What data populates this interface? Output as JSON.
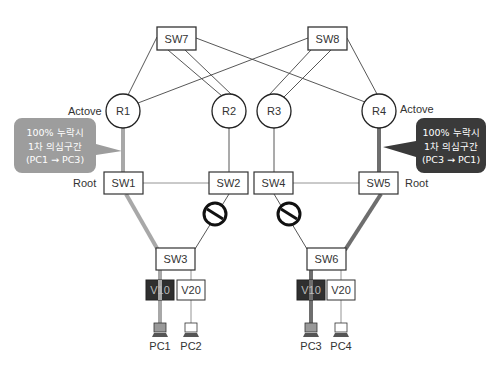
{
  "diagram": {
    "colors": {
      "line": "#444444",
      "path_left": "#a8a8a8",
      "path_right": "#6e6e6e",
      "callout_left": "#9d9d9d",
      "callout_right": "#3a3a3a",
      "vlan_dark": "#2f2f2f"
    },
    "core_switches": [
      {
        "id": "SW7",
        "label": "SW7"
      },
      {
        "id": "SW8",
        "label": "SW8"
      }
    ],
    "routers": [
      {
        "id": "R1",
        "label": "R1",
        "role": "Actove"
      },
      {
        "id": "R2",
        "label": "R2"
      },
      {
        "id": "R3",
        "label": "R3"
      },
      {
        "id": "R4",
        "label": "R4",
        "role": "Actove"
      }
    ],
    "dist_switches": [
      {
        "id": "SW1",
        "label": "SW1",
        "role": "Root"
      },
      {
        "id": "SW2",
        "label": "SW2"
      },
      {
        "id": "SW4",
        "label": "SW4"
      },
      {
        "id": "SW5",
        "label": "SW5",
        "role": "Root"
      }
    ],
    "access_switches": [
      {
        "id": "SW3",
        "label": "SW3"
      },
      {
        "id": "SW6",
        "label": "SW6"
      }
    ],
    "vlans": [
      {
        "label": "V10",
        "style": "dark"
      },
      {
        "label": "V20",
        "style": "light"
      },
      {
        "label": "V10",
        "style": "dark"
      },
      {
        "label": "V20",
        "style": "light"
      }
    ],
    "pcs": [
      {
        "label": "PC1"
      },
      {
        "label": "PC2"
      },
      {
        "label": "PC3"
      },
      {
        "label": "PC4"
      }
    ],
    "blocked_links": [
      "SW2-SW3",
      "SW4-SW6"
    ],
    "callouts": [
      {
        "lines": [
          "100% 누락시",
          "1차 의심구간",
          "(PC1 → PC3)"
        ]
      },
      {
        "lines": [
          "100% 누락시",
          "1차 의심구간",
          "(PC3 → PC1)"
        ]
      }
    ]
  }
}
